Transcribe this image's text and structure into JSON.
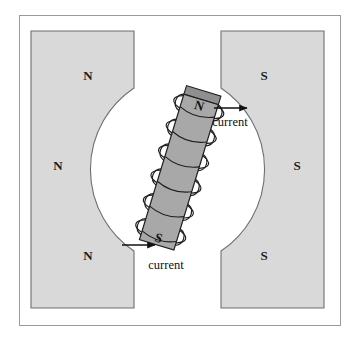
{
  "figure": {
    "frame": {
      "border_color": "#999999",
      "background": "#ffffff"
    },
    "colors": {
      "pole_fill": "#d9d9d9",
      "pole_stroke": "#6e6e6e",
      "core_fill": "#a8a8a8",
      "core_end_fill": "#8f8f8f",
      "core_stroke": "#1f1f1f",
      "coil_stroke": "#1f1f1f",
      "arrow_color": "#111111",
      "text_color": "#111111",
      "gap_fill": "#ffffff"
    },
    "left_pole": {
      "polarity": "N",
      "labels": [
        {
          "text": "N",
          "x": 88,
          "y": 80
        },
        {
          "text": "N",
          "x": 58,
          "y": 170
        },
        {
          "text": "N",
          "x": 88,
          "y": 260
        }
      ]
    },
    "right_pole": {
      "polarity": "S",
      "labels": [
        {
          "text": "S",
          "x": 264,
          "y": 80
        },
        {
          "text": "S",
          "x": 297,
          "y": 170
        },
        {
          "text": "S",
          "x": 264,
          "y": 260
        }
      ]
    },
    "solenoid": {
      "tilt_degrees": 17,
      "turns": 6,
      "north_label": "N",
      "south_label": "S",
      "north_label_pos": {
        "x": 192,
        "y": 103
      },
      "south_label_pos": {
        "x": 166,
        "y": 250
      }
    },
    "current_annotations": [
      {
        "label": "current",
        "arrow_direction": "right",
        "arrow_x1": 214,
        "arrow_y1": 108,
        "arrow_x2": 249,
        "arrow_y2": 108,
        "label_x": 228,
        "label_y": 124
      },
      {
        "label": "current",
        "arrow_direction": "right",
        "arrow_x1": 122,
        "arrow_y1": 245,
        "arrow_x2": 157,
        "arrow_y2": 245,
        "label_x": 165,
        "label_y": 268
      }
    ]
  }
}
